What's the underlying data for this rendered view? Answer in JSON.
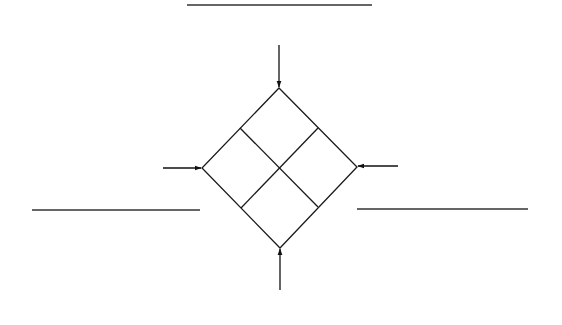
{
  "diagram": {
    "title": "",
    "stroke_color": "#1a1a1a",
    "line_color": "#333333",
    "background": "#ffffff",
    "top_line": {
      "x1": 187,
      "y1": 5,
      "x2": 372,
      "y2": 5
    },
    "left_line": {
      "x1": 32,
      "y1": 210,
      "x2": 200,
      "y2": 210
    },
    "right_line": {
      "x1": 357,
      "y1": 209,
      "x2": 528,
      "y2": 209
    },
    "diamond": {
      "top": [
        279,
        88
      ],
      "right": [
        357,
        167
      ],
      "bottom": [
        280,
        248
      ],
      "left": [
        202,
        168
      ],
      "divider_a": [
        [
          240,
          128
        ],
        [
          318,
          207
        ]
      ],
      "divider_b": [
        [
          318,
          128
        ],
        [
          241,
          208
        ]
      ]
    },
    "arrows": [
      {
        "name": "top-arrow",
        "direction": "down",
        "x1": 279,
        "y1": 45,
        "x2": 279,
        "y2": 87
      },
      {
        "name": "left-arrow",
        "direction": "right",
        "x1": 163,
        "y1": 168,
        "x2": 201,
        "y2": 168
      },
      {
        "name": "right-arrow",
        "direction": "left",
        "x1": 398,
        "y1": 166,
        "x2": 358,
        "y2": 166
      },
      {
        "name": "bottom-arrow",
        "direction": "up",
        "x1": 280,
        "y1": 290,
        "x2": 280,
        "y2": 249
      }
    ]
  }
}
